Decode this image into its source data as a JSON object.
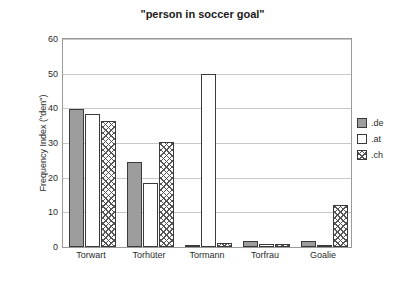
{
  "chart_data": {
    "type": "bar",
    "title": "\"person in soccer goal\"",
    "xlabel": "",
    "ylabel": "Frequency Index (\"den\")",
    "categories": [
      "Torwart",
      "Torhüter",
      "Tormann",
      "Torfrau",
      "Goalie"
    ],
    "series": [
      {
        "name": ".de",
        "values": [
          39.8,
          24.5,
          0.6,
          1.6,
          1.8
        ]
      },
      {
        "name": ".at",
        "values": [
          38.5,
          18.5,
          50.0,
          1.0,
          0.6
        ]
      },
      {
        "name": ".ch",
        "values": [
          36.3,
          30.2,
          1.2,
          0.8,
          12.2
        ]
      }
    ],
    "yticks": [
      0,
      10,
      20,
      30,
      40,
      50,
      60
    ],
    "ylim": [
      0,
      60
    ],
    "grid": true,
    "legend_position": "right"
  },
  "legend": {
    "items": [
      {
        "label": ".de",
        "swatch": "grey-solid"
      },
      {
        "label": ".at",
        "swatch": "white-solid"
      },
      {
        "label": ".ch",
        "swatch": "crosshatch"
      }
    ]
  },
  "colors": {
    "de": "#9d9d9d",
    "at": "#ffffff",
    "ch": "#ffffff",
    "outline": "#3a3a3a",
    "grid": "#c8c8c8",
    "frame": "#9a9a9a",
    "text": "#2b2b2b"
  }
}
